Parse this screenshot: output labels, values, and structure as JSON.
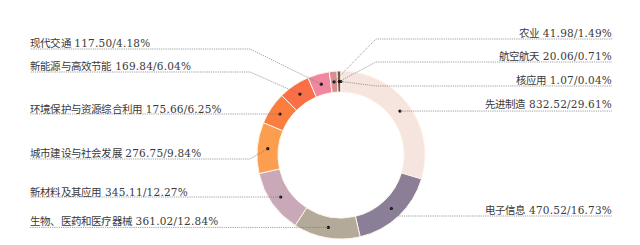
{
  "chart_data": {
    "type": "pie",
    "variant": "donut",
    "title": "",
    "unit_note": "value/percentage",
    "slices": [
      {
        "label": "先进制造",
        "value": 832.52,
        "percent": 29.61,
        "color": "#f6e4df",
        "side": "right",
        "label_y": 98
      },
      {
        "label": "电子信息",
        "value": 470.52,
        "percent": 16.73,
        "color": "#8b7f98",
        "side": "right",
        "label_y": 204
      },
      {
        "label": "生物、医药和医疗器械",
        "value": 361.02,
        "percent": 12.84,
        "color": "#b3aa9a",
        "side": "left",
        "label_y": 215
      },
      {
        "label": "新材料及其应用",
        "value": 345.11,
        "percent": 12.27,
        "color": "#c9a9b8",
        "side": "left",
        "label_y": 186
      },
      {
        "label": "城市建设与社会发展",
        "value": 276.75,
        "percent": 9.84,
        "color": "#fb9e4f",
        "side": "left",
        "label_y": 147
      },
      {
        "label": "环境保护与资源综合利用",
        "value": 175.66,
        "percent": 6.25,
        "color": "#fb7e3e",
        "side": "left",
        "label_y": 103
      },
      {
        "label": "新能源与高效节能",
        "value": 169.84,
        "percent": 6.04,
        "color": "#fa6f45",
        "side": "left",
        "label_y": 60
      },
      {
        "label": "现代交通",
        "value": 117.5,
        "percent": 4.18,
        "color": "#f0879e",
        "side": "left",
        "label_y": 37
      },
      {
        "label": "农业",
        "value": 41.98,
        "percent": 1.49,
        "color": "#d98f92",
        "side": "right",
        "label_y": 27
      },
      {
        "label": "航空航天",
        "value": 20.06,
        "percent": 0.71,
        "color": "#6f5a4a",
        "side": "right",
        "label_y": 50
      },
      {
        "label": "核应用",
        "value": 1.07,
        "percent": 0.04,
        "color": "#3a2a20",
        "side": "right",
        "label_y": 74
      }
    ],
    "legend": "none (leader-line labels)",
    "label_format": "{label} {value}/{percent}%"
  }
}
